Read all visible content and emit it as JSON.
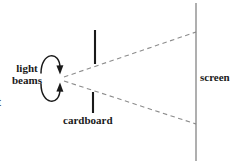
{
  "figure": {
    "background_color": "#ffffff",
    "line_color": "#1a1a1a",
    "dash_color": "#8c8c8c",
    "screen_color": "#7a7a7a"
  },
  "labels": {
    "light": "light",
    "beams": "beams",
    "cardboard": "cardboard",
    "screen": "screen",
    "clipped_left_text": "t"
  },
  "diagram_data": {
    "type": "ray-diagram",
    "source_point": [
      62,
      78
    ],
    "beams": [
      {
        "name": "upper-beam",
        "style": "dashed",
        "from": [
          62,
          77
        ],
        "to": [
          196,
          32
        ]
      },
      {
        "name": "lower-beam",
        "style": "dashed",
        "from": [
          62,
          80
        ],
        "to": [
          196,
          124
        ]
      }
    ],
    "cardboard_bars": [
      {
        "name": "upper-bar",
        "x": 95,
        "y_top": 30,
        "y_bottom": 64
      },
      {
        "name": "lower-bar",
        "x": 93,
        "y_top": 92,
        "y_bottom": 113
      }
    ],
    "screen_line": {
      "x": 196,
      "y_top": 3,
      "y_bottom": 161
    },
    "arrows": [
      {
        "name": "upper-curved-arrow",
        "direction": "clockwise-down",
        "tip": [
          60,
          73
        ]
      },
      {
        "name": "lower-curved-arrow",
        "direction": "counterclockwise-up",
        "tip": [
          60,
          84
        ]
      }
    ]
  }
}
